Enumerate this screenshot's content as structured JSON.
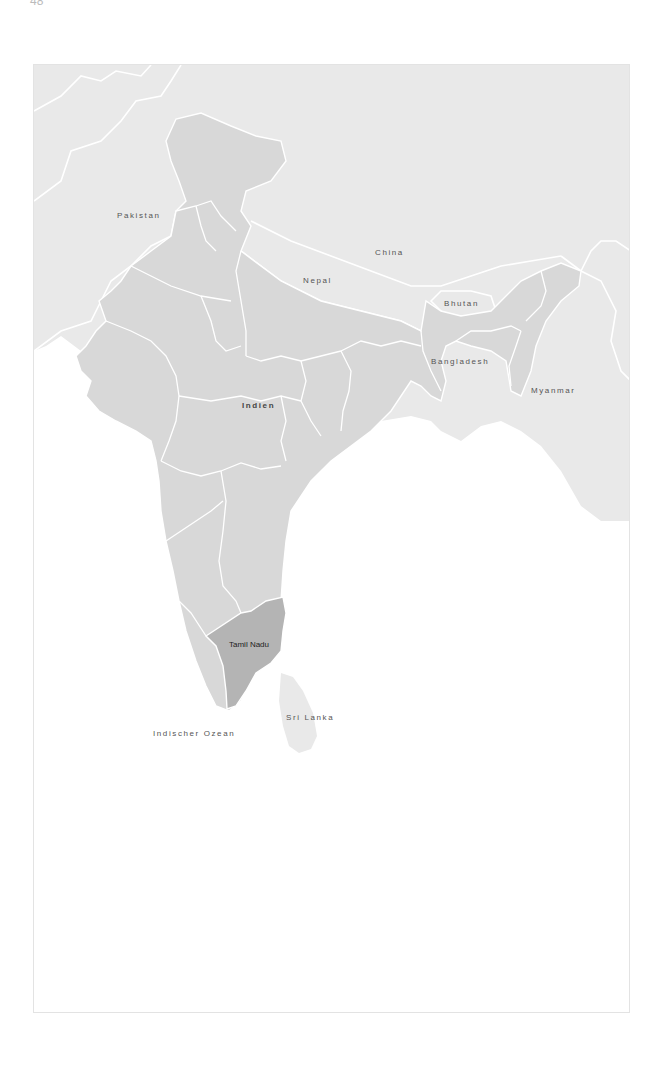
{
  "page": {
    "number": "48"
  },
  "map": {
    "colors": {
      "india": "#d8d8d8",
      "neighbor": "#e9e9e9",
      "highlight": "#b4b4b4",
      "border": "#ffffff",
      "sea": "#ffffff",
      "frame": "#e3e3e3"
    },
    "highlighted_region": "Tamil Nadu",
    "labels": {
      "pakistan": "Pakistan",
      "china": "China",
      "nepal": "Nepal",
      "bhutan": "Bhutan",
      "bangladesh": "Bangladesh",
      "myanmar": "Myanmar",
      "india": "Indien",
      "tamil_nadu": "Tamil Nadu",
      "sri_lanka": "Sri Lanka",
      "ocean": "Indischer Ozean"
    }
  }
}
